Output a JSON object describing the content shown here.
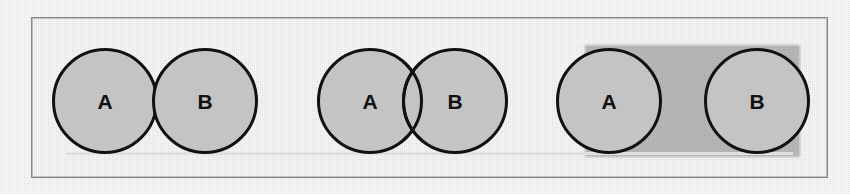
{
  "figure": {
    "caption": "",
    "frame": {
      "border_color": "#8e8e8e",
      "background_color": "#fdfdfd"
    },
    "style": {
      "circle_fill": "#c4c4c4",
      "circle_stroke": "#111111",
      "label_color": "#111111",
      "smudge_color": "#b5b5b5"
    },
    "groups": [
      {
        "id": "tangent-pair",
        "relation": "tangent",
        "circles": [
          {
            "label": "A",
            "left": 52,
            "top": 48,
            "size": 106
          },
          {
            "label": "B",
            "left": 152,
            "top": 48,
            "size": 106
          }
        ],
        "smudge": null
      },
      {
        "id": "overlapping-pair",
        "relation": "overlapping",
        "circles": [
          {
            "label": "A",
            "left": 317,
            "top": 48,
            "size": 106
          },
          {
            "label": "B",
            "left": 402,
            "top": 48,
            "size": 106
          }
        ],
        "smudge": null
      },
      {
        "id": "disjoint-pair",
        "relation": "disjoint",
        "circles": [
          {
            "label": "A",
            "left": 556,
            "top": 48,
            "size": 106
          },
          {
            "label": "B",
            "left": 704,
            "top": 48,
            "size": 106
          }
        ],
        "smudge": {
          "left": 585,
          "top": 45,
          "width": 215,
          "height": 112
        }
      }
    ]
  }
}
